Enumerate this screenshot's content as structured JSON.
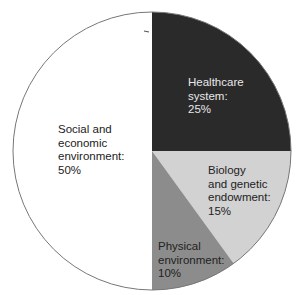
{
  "chart_data": {
    "type": "pie",
    "title": "",
    "start_angle_deg": 0,
    "direction": "clockwise",
    "slices": [
      {
        "label": "Healthcare system",
        "value": 25,
        "display": "Healthcare\nsystem:\n25%",
        "color": "#2a2a2a"
      },
      {
        "label": "Biology and genetic endowment",
        "value": 15,
        "display": "Biology\nand genetic\nendowment:\n15%",
        "color": "#d2d2d2"
      },
      {
        "label": "Physical environment",
        "value": 10,
        "display": "Physical\nenvironment:\n10%",
        "color": "#8c8c8c"
      },
      {
        "label": "Social and economic environment",
        "value": 50,
        "display": "Social and\neconomic\nenvironment:\n50%",
        "color": "#ffffff"
      }
    ],
    "legend": "none (labels inside slices)"
  }
}
